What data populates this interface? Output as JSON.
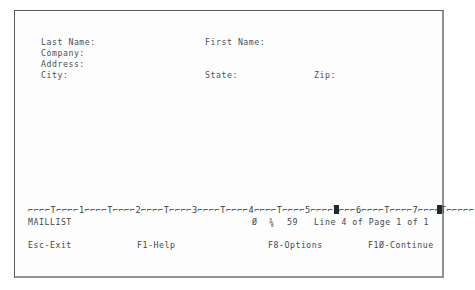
{
  "app": {
    "document_name": "MAILLIST",
    "screen_title": "MAILLIST"
  },
  "form": {
    "fields": [
      {
        "label": "Last Name:",
        "value": "",
        "column": "left",
        "row": 1
      },
      {
        "label": "First Name:",
        "value": "",
        "column": "mid",
        "row": 1
      },
      {
        "label": "Company:",
        "value": "",
        "column": "left",
        "row": 2
      },
      {
        "label": "Address:",
        "value": "",
        "column": "left",
        "row": 3
      },
      {
        "label": "City:",
        "value": "",
        "column": "left",
        "row": 4
      },
      {
        "label": "State:",
        "value": "",
        "column": "mid",
        "row": 4
      },
      {
        "label": "Zip:",
        "value": "",
        "column": "right",
        "row": 4
      }
    ]
  },
  "ruler": {
    "text": "⌐⌐⌐⌐T⌐⌐⌐⌐1⌐⌐⌐⌐T⌐⌐⌐⌐2⌐⌐⌐⌐T⌐⌐⌐⌐3⌐⌐⌐⌐T⌐⌐⌐⌐4⌐⌐⌐⌐T⌐⌐⌐⌐5⌐⌐⌐⌐T⌐⌐⌐6⌐⌐⌐⌐T⌐⌐⌐⌐7⌐⌐⌐⌐T⌐⌐⌐⌐⌐",
    "tab_marker_char": "T",
    "tick_char": "⌐",
    "markers": [
      {
        "name": "left-block-marker",
        "x": 319
      },
      {
        "name": "right-margin-marker",
        "x": 422
      }
    ],
    "marker_color": "#24282b"
  },
  "status": {
    "document": "MAILLIST",
    "column": "Ø",
    "style": "⅜",
    "width": "59",
    "line_info": "Line 4 of Page 1 of 1",
    "line_number": "4",
    "page_number": "1",
    "page_total": "1"
  },
  "function_keys": [
    {
      "name": "esc-exit",
      "label": "Esc-Exit"
    },
    {
      "name": "f1-help",
      "label": "F1-Help"
    },
    {
      "name": "f8-options",
      "label": "F8-Options"
    },
    {
      "name": "f10-continue",
      "label": "F1Ø-Continue"
    }
  ],
  "colors": {
    "background": "#ffffff",
    "screen": "#fdfdfd",
    "text": "#43484b",
    "label_text": "#4d5255",
    "marker": "#24282b",
    "frame_dark": "#555a5c",
    "frame_light": "#8d9295"
  }
}
